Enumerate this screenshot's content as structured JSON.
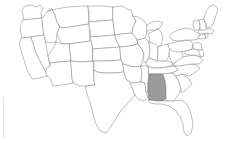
{
  "map": {
    "title": "United States map",
    "type": "choropleth",
    "projection": "albers-usa",
    "background_color": "#ffffff",
    "border_color": "#8a8a8a",
    "default_fill": "#ffffff",
    "highlight_fill": "#9b9b9b",
    "highlight_border_color": "#6f6f6f",
    "highlighted_count": 1,
    "highlighted_states": [
      "Alabama"
    ],
    "legend": null,
    "labels_visible": false,
    "states": [
      {
        "code": "WA",
        "name": "Washington",
        "highlighted": false
      },
      {
        "code": "OR",
        "name": "Oregon",
        "highlighted": false
      },
      {
        "code": "CA",
        "name": "California",
        "highlighted": false
      },
      {
        "code": "NV",
        "name": "Nevada",
        "highlighted": false
      },
      {
        "code": "ID",
        "name": "Idaho",
        "highlighted": false
      },
      {
        "code": "MT",
        "name": "Montana",
        "highlighted": false
      },
      {
        "code": "WY",
        "name": "Wyoming",
        "highlighted": false
      },
      {
        "code": "UT",
        "name": "Utah",
        "highlighted": false
      },
      {
        "code": "AZ",
        "name": "Arizona",
        "highlighted": false
      },
      {
        "code": "CO",
        "name": "Colorado",
        "highlighted": false
      },
      {
        "code": "NM",
        "name": "New Mexico",
        "highlighted": false
      },
      {
        "code": "ND",
        "name": "North Dakota",
        "highlighted": false
      },
      {
        "code": "SD",
        "name": "South Dakota",
        "highlighted": false
      },
      {
        "code": "NE",
        "name": "Nebraska",
        "highlighted": false
      },
      {
        "code": "KS",
        "name": "Kansas",
        "highlighted": false
      },
      {
        "code": "OK",
        "name": "Oklahoma",
        "highlighted": false
      },
      {
        "code": "TX",
        "name": "Texas",
        "highlighted": false
      },
      {
        "code": "MN",
        "name": "Minnesota",
        "highlighted": false
      },
      {
        "code": "IA",
        "name": "Iowa",
        "highlighted": false
      },
      {
        "code": "MO",
        "name": "Missouri",
        "highlighted": false
      },
      {
        "code": "AR",
        "name": "Arkansas",
        "highlighted": false
      },
      {
        "code": "LA",
        "name": "Louisiana",
        "highlighted": false
      },
      {
        "code": "WI",
        "name": "Wisconsin",
        "highlighted": false
      },
      {
        "code": "IL",
        "name": "Illinois",
        "highlighted": false
      },
      {
        "code": "MS",
        "name": "Mississippi",
        "highlighted": false
      },
      {
        "code": "MI",
        "name": "Michigan",
        "highlighted": false
      },
      {
        "code": "IN",
        "name": "Indiana",
        "highlighted": false
      },
      {
        "code": "OH",
        "name": "Ohio",
        "highlighted": false
      },
      {
        "code": "KY",
        "name": "Kentucky",
        "highlighted": false
      },
      {
        "code": "TN",
        "name": "Tennessee",
        "highlighted": false
      },
      {
        "code": "AL",
        "name": "Alabama",
        "highlighted": true
      },
      {
        "code": "GA",
        "name": "Georgia",
        "highlighted": false
      },
      {
        "code": "FL",
        "name": "Florida",
        "highlighted": false
      },
      {
        "code": "SC",
        "name": "South Carolina",
        "highlighted": false
      },
      {
        "code": "NC",
        "name": "North Carolina",
        "highlighted": false
      },
      {
        "code": "VA",
        "name": "Virginia",
        "highlighted": false
      },
      {
        "code": "WV",
        "name": "West Virginia",
        "highlighted": false
      },
      {
        "code": "PA",
        "name": "Pennsylvania",
        "highlighted": false
      },
      {
        "code": "NY",
        "name": "New York",
        "highlighted": false
      },
      {
        "code": "MD",
        "name": "Maryland",
        "highlighted": false
      },
      {
        "code": "DE",
        "name": "Delaware",
        "highlighted": false
      },
      {
        "code": "NJ",
        "name": "New Jersey",
        "highlighted": false
      },
      {
        "code": "CT",
        "name": "Connecticut",
        "highlighted": false
      },
      {
        "code": "RI",
        "name": "Rhode Island",
        "highlighted": false
      },
      {
        "code": "MA",
        "name": "Massachusetts",
        "highlighted": false
      },
      {
        "code": "VT",
        "name": "Vermont",
        "highlighted": false
      },
      {
        "code": "NH",
        "name": "New Hampshire",
        "highlighted": false
      },
      {
        "code": "ME",
        "name": "Maine",
        "highlighted": false
      }
    ]
  }
}
